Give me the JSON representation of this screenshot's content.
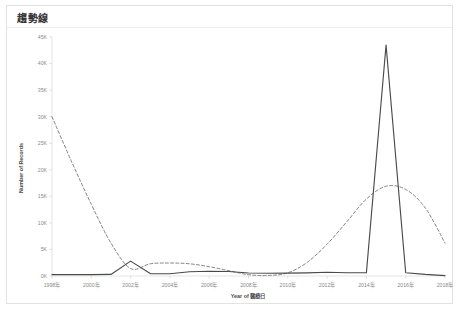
{
  "card": {
    "title": "趨勢線"
  },
  "chart_data": {
    "type": "line",
    "title": "趨勢線",
    "xlabel": "Year of 醫療日",
    "ylabel": "Number of Records",
    "grid": false,
    "legend_position": "none",
    "xlim": [
      1998,
      2018
    ],
    "ylim": [
      0,
      45000
    ],
    "y_ticks": [
      0,
      5000,
      10000,
      15000,
      20000,
      25000,
      30000,
      35000,
      40000,
      45000
    ],
    "y_tick_labels": [
      "0K",
      "5K",
      "10K",
      "15K",
      "20K",
      "25K",
      "30K",
      "35K",
      "40K",
      "45K"
    ],
    "x_ticks": [
      1998,
      2000,
      2002,
      2004,
      2006,
      2008,
      2010,
      2012,
      2014,
      2016,
      2018
    ],
    "x_tick_labels": [
      "1998年",
      "2000年",
      "2002年",
      "2004年",
      "2006年",
      "2008年",
      "2010年",
      "2012年",
      "2014年",
      "2016年",
      "2018年"
    ],
    "x": [
      1998,
      1999,
      2000,
      2001,
      2002,
      2003,
      2004,
      2005,
      2006,
      2007,
      2008,
      2009,
      2010,
      2011,
      2012,
      2013,
      2014,
      2015,
      2016,
      2017,
      2018
    ],
    "series": [
      {
        "name": "Number of Records",
        "style": "solid",
        "color": "#4a4a4a",
        "values": [
          250,
          250,
          260,
          300,
          2800,
          450,
          420,
          800,
          900,
          850,
          560,
          520,
          540,
          600,
          700,
          620,
          620,
          43500,
          620,
          300,
          80
        ]
      },
      {
        "name": "Trend Line",
        "style": "dashed",
        "color": "#6e6e6e",
        "values": [
          30000,
          21500,
          13500,
          6200,
          1400,
          2300,
          2450,
          2300,
          1750,
          1000,
          250,
          100,
          600,
          2600,
          6000,
          10200,
          14500,
          16900,
          16300,
          12800,
          6200
        ]
      }
    ]
  }
}
